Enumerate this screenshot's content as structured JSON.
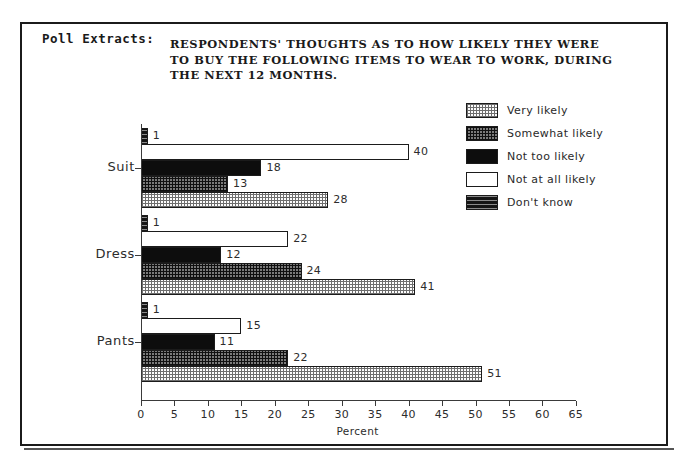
{
  "frame": {
    "label": "Poll Extracts:"
  },
  "header": {
    "title_lines": [
      "RESPONDENTS' THOUGHTS AS TO HOW LIKELY THEY WERE",
      "TO BUY THE FOLLOWING ITEMS TO WEAR TO WORK, DURING",
      "THE NEXT 12 MONTHS."
    ]
  },
  "legend": {
    "items": [
      {
        "label": "Very likely",
        "pattern": "p-very"
      },
      {
        "label": "Somewhat likely",
        "pattern": "p-somewhat"
      },
      {
        "label": "Not too likely",
        "pattern": "p-nottoo"
      },
      {
        "label": "Not at all likely",
        "pattern": "p-notatall"
      },
      {
        "label": "Don't know",
        "pattern": "p-dontknow"
      }
    ]
  },
  "chart_data": {
    "type": "bar",
    "orientation": "horizontal",
    "grouped": true,
    "title": "RESPONDENTS' THOUGHTS AS TO HOW LIKELY THEY WERE TO BUY THE FOLLOWING ITEMS TO WEAR TO WORK, DURING THE NEXT 12 MONTHS.",
    "xlabel": "Percent",
    "ylabel": "",
    "xlim": [
      0,
      65
    ],
    "xticks": [
      0,
      5,
      10,
      15,
      20,
      25,
      30,
      35,
      40,
      45,
      50,
      55,
      60,
      65
    ],
    "grid": false,
    "legend_position": "top-right",
    "categories": [
      "Suit",
      "Dress",
      "Pants"
    ],
    "series_order_top_to_bottom": [
      "Don't know",
      "Not at all likely",
      "Not too likely",
      "Somewhat likely",
      "Very likely"
    ],
    "series": [
      {
        "name": "Very likely",
        "pattern": "p-very",
        "values": [
          28,
          41,
          51
        ]
      },
      {
        "name": "Somewhat likely",
        "pattern": "p-somewhat",
        "values": [
          13,
          24,
          22
        ]
      },
      {
        "name": "Not too likely",
        "pattern": "p-nottoo",
        "values": [
          18,
          12,
          11
        ]
      },
      {
        "name": "Not at all likely",
        "pattern": "p-notatall",
        "values": [
          40,
          22,
          15
        ]
      },
      {
        "name": "Don't know",
        "pattern": "p-dontknow",
        "values": [
          1,
          1,
          1
        ]
      }
    ]
  },
  "geometry": {
    "x0": 141,
    "px_per_unit": 6.69,
    "bar_h": 16,
    "group_tops": [
      128,
      215,
      302
    ],
    "axis_y": 400,
    "axis_top": 124,
    "cat_label_y": [
      168,
      255,
      342
    ]
  }
}
